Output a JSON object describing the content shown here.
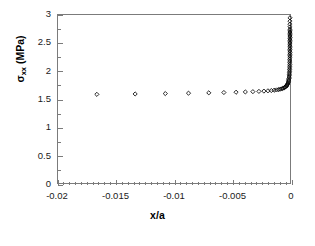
{
  "chart_data": {
    "type": "scatter",
    "title": "",
    "xlabel": "x/a",
    "ylabel_text": "σxx (MPa)",
    "ylabel_symbol": "σ",
    "ylabel_subscript": "xx",
    "ylabel_units": "(MPa)",
    "xlim": [
      -0.02,
      0
    ],
    "ylim": [
      0,
      3
    ],
    "grid": false,
    "legend": false,
    "marker": "open-diamond",
    "marker_color": "#000000",
    "xticks": [
      -0.02,
      -0.015,
      -0.01,
      -0.005,
      0
    ],
    "xtick_labels": [
      "-0.02",
      "-0.015",
      "-0.01",
      "-0.005",
      "0"
    ],
    "yticks": [
      0,
      0.5,
      1,
      1.5,
      2,
      2.5,
      3
    ],
    "ytick_labels": [
      "0",
      "0.5",
      "1",
      "1.5",
      "2",
      "2.5",
      "3"
    ],
    "x_minor_tick_count": 40,
    "y_minor_tick_count": 12,
    "series": [
      {
        "name": "sigma_xx",
        "x": [
          -0.01665,
          -0.01335,
          -0.01075,
          -0.00875,
          -0.007,
          -0.0057,
          -0.00465,
          -0.00385,
          -0.0032,
          -0.00268,
          -0.00225,
          -0.0019,
          -0.00161,
          -0.00137,
          -0.00117,
          -0.001,
          -0.00086,
          -0.00074,
          -0.00064,
          -0.00055,
          -0.00047,
          -0.00041,
          -0.00035,
          -0.0003,
          -0.00026,
          -0.00022,
          -0.00019,
          -0.00016,
          -0.00014,
          -0.00012,
          -0.0001,
          -8.7e-05,
          -7.4e-05,
          -6.3e-05,
          -5.4e-05,
          -4.6e-05,
          -3.9e-05,
          -3.3e-05,
          -2.8e-05,
          -2.4e-05,
          -2e-05,
          -1.7e-05,
          -1.45e-05,
          -1.23e-05,
          -1.05e-05,
          -8.9e-06,
          -7.6e-06,
          -6.4e-06,
          -5.5e-06,
          -4.7e-06,
          -4e-06,
          -3.4e-06,
          -2.9e-06,
          -2.4e-06,
          -2.1e-06,
          -1.7e-06,
          -1.5e-06,
          -1.2e-06,
          -1.1e-06,
          -9e-07,
          -8e-07,
          -6e-07,
          -5e-07,
          -4e-07,
          -3e-07,
          -2e-07,
          -1e-07,
          0.0
        ],
        "y": [
          1.583,
          1.59,
          1.597,
          1.604,
          1.61,
          1.616,
          1.621,
          1.626,
          1.631,
          1.636,
          1.641,
          1.646,
          1.651,
          1.657,
          1.662,
          1.668,
          1.674,
          1.681,
          1.688,
          1.696,
          1.704,
          1.713,
          1.723,
          1.734,
          1.746,
          1.759,
          1.773,
          1.789,
          1.806,
          1.825,
          1.845,
          1.867,
          1.89,
          1.915,
          1.941,
          1.968,
          1.996,
          2.025,
          2.055,
          2.085,
          2.116,
          2.147,
          2.178,
          2.209,
          2.24,
          2.27,
          2.3,
          2.33,
          2.359,
          2.388,
          2.416,
          2.444,
          2.471,
          2.498,
          2.524,
          2.55,
          2.575,
          2.6,
          2.625,
          2.649,
          2.673,
          2.697,
          2.721,
          2.745,
          2.79,
          2.835,
          2.89,
          2.95
        ]
      }
    ]
  },
  "axes": {
    "x_axis_name": "x-axis",
    "y_axis_name": "y-axis",
    "plot_frame_color": "#7b7b7b"
  }
}
